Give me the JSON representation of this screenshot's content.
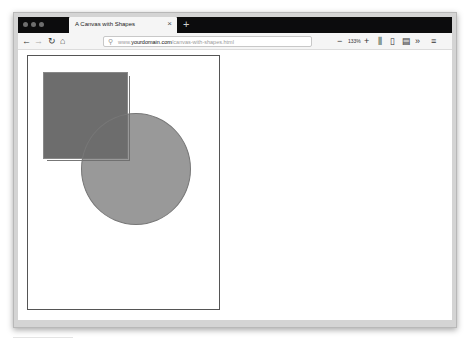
{
  "window": {
    "traffic_lights": [
      "close",
      "minimize",
      "maximize"
    ]
  },
  "tabs": [
    {
      "title": "A Canvas with Shapes",
      "close_icon": "×",
      "active": true
    }
  ],
  "new_tab_icon": "+",
  "toolbar": {
    "back_icon": "←",
    "forward_icon": "→",
    "reload_icon": "↻",
    "home_icon": "⌂",
    "url": {
      "search_icon": "⚲",
      "prefix": "www.",
      "domain": "yourdomain.com",
      "path": "/canvas-with-shapes.html"
    },
    "zoom_out": "−",
    "zoom_level": "133%",
    "zoom_in": "+",
    "library_icon": "⫼",
    "sidebar_icon": "▯",
    "reader_icon": "▤",
    "overflow_icon": "»",
    "menu_icon": "≡"
  },
  "canvas": {
    "shapes": [
      {
        "type": "rect",
        "fill": "#3c3c3c",
        "opacity": 0.75
      },
      {
        "type": "circle",
        "fill": "#6e6e6e",
        "opacity": 0.7
      }
    ]
  }
}
